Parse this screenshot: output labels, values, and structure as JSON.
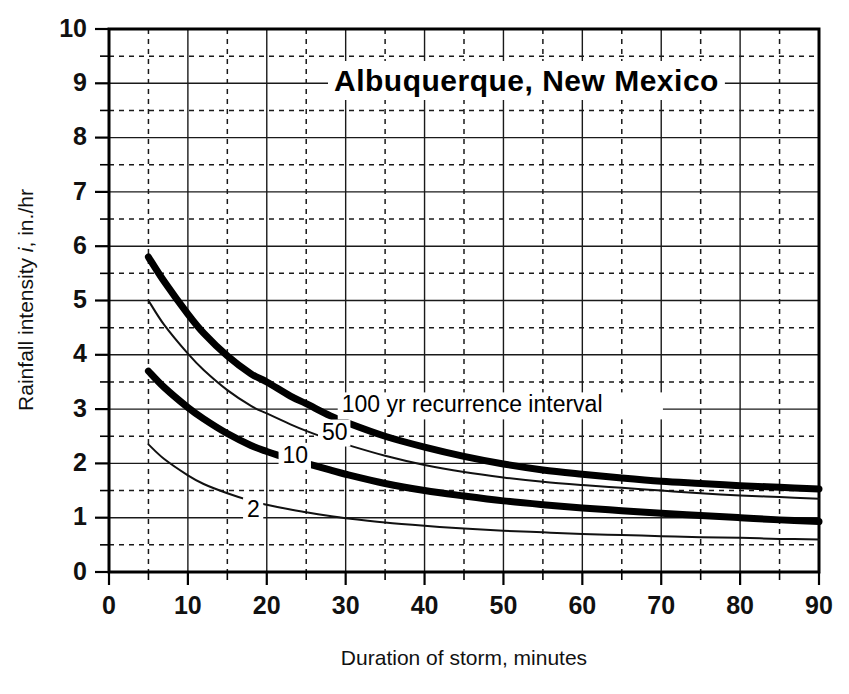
{
  "chart_data": {
    "type": "line",
    "title": "Albuquerque,  New Mexico",
    "xlabel": "Duration of storm, minutes",
    "ylabel_parts": {
      "pre": "Rainfall intensity ",
      "italic": "i",
      "post": ", in./hr"
    },
    "ylabel_text": "Rainfall intensity i, in./hr",
    "xlim": [
      0,
      90
    ],
    "ylim": [
      0,
      10
    ],
    "x_major_ticks": [
      0,
      10,
      20,
      30,
      40,
      50,
      60,
      70,
      80,
      90
    ],
    "x_minor_ticks": [
      5,
      15,
      25,
      35,
      45,
      55,
      65,
      75,
      85
    ],
    "x_tick_labels": [
      "0",
      "10",
      "20",
      "30",
      "40",
      "50",
      "60",
      "70",
      "80",
      "90"
    ],
    "y_major_ticks": [
      0,
      1,
      2,
      3,
      4,
      5,
      6,
      7,
      8,
      9,
      10
    ],
    "y_minor_ticks": [
      0.5,
      1.5,
      2.5,
      3.5,
      4.5,
      5.5,
      6.5,
      7.5,
      8.5,
      9.5
    ],
    "y_tick_labels": [
      "0",
      "1",
      "2",
      "3",
      "4",
      "5",
      "6",
      "7",
      "8",
      "9",
      "10"
    ],
    "grid": {
      "major": "solid",
      "minor": "dashed",
      "enabled": true
    },
    "legend_position": "inline-curve-labels",
    "annotations": [
      {
        "text": "100 yr recurrence interval",
        "x": 29.5,
        "y": 3.05,
        "series": "100"
      },
      {
        "text": "50",
        "x": 27.0,
        "y": 2.55,
        "series": "50"
      },
      {
        "text": "10",
        "x": 22.0,
        "y": 2.12,
        "series": "10"
      },
      {
        "text": "2",
        "x": 17.5,
        "y": 1.12,
        "series": "2"
      }
    ],
    "series": [
      {
        "name": "100",
        "label": "100 yr recurrence interval",
        "style": "thick",
        "x": [
          5,
          7,
          10,
          12,
          15,
          18,
          20,
          23,
          25,
          28,
          30,
          35,
          40,
          45,
          50,
          55,
          60,
          65,
          70,
          75,
          80,
          85,
          90
        ],
        "values": [
          5.8,
          5.35,
          4.75,
          4.4,
          3.98,
          3.65,
          3.5,
          3.24,
          3.1,
          2.88,
          2.76,
          2.5,
          2.3,
          2.13,
          1.99,
          1.88,
          1.8,
          1.73,
          1.67,
          1.63,
          1.59,
          1.56,
          1.53
        ]
      },
      {
        "name": "50",
        "label": "50",
        "style": "thin",
        "x": [
          5,
          7,
          10,
          12,
          15,
          18,
          20,
          23,
          25,
          28,
          30,
          35,
          40,
          45,
          50,
          55,
          60,
          65,
          70,
          75,
          80,
          85,
          90
        ],
        "values": [
          5.0,
          4.55,
          4.02,
          3.72,
          3.35,
          3.06,
          2.92,
          2.72,
          2.6,
          2.44,
          2.35,
          2.14,
          1.97,
          1.84,
          1.74,
          1.66,
          1.6,
          1.55,
          1.5,
          1.45,
          1.41,
          1.38,
          1.35
        ]
      },
      {
        "name": "10",
        "label": "10",
        "style": "thick",
        "x": [
          5,
          7,
          10,
          12,
          15,
          18,
          20,
          23,
          25,
          28,
          30,
          35,
          40,
          45,
          50,
          55,
          60,
          65,
          70,
          75,
          80,
          85,
          90
        ],
        "values": [
          3.7,
          3.4,
          3.03,
          2.82,
          2.55,
          2.33,
          2.22,
          2.08,
          2.0,
          1.88,
          1.8,
          1.63,
          1.5,
          1.4,
          1.31,
          1.24,
          1.18,
          1.13,
          1.08,
          1.04,
          1.0,
          0.96,
          0.93
        ]
      },
      {
        "name": "2",
        "label": "2",
        "style": "thin",
        "x": [
          5,
          7,
          10,
          12,
          15,
          18,
          20,
          23,
          25,
          28,
          30,
          35,
          40,
          45,
          50,
          55,
          60,
          65,
          70,
          75,
          80,
          85,
          90
        ],
        "values": [
          2.35,
          2.08,
          1.78,
          1.62,
          1.45,
          1.31,
          1.24,
          1.15,
          1.1,
          1.03,
          0.99,
          0.91,
          0.85,
          0.8,
          0.76,
          0.73,
          0.7,
          0.68,
          0.66,
          0.64,
          0.63,
          0.61,
          0.6
        ]
      }
    ]
  },
  "geometry": {
    "plot_left": 109,
    "plot_right": 819,
    "plot_top": 29,
    "plot_bottom": 572
  }
}
